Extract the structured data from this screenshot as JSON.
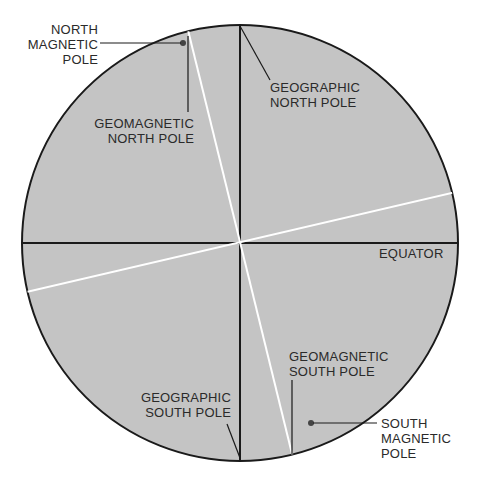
{
  "diagram": {
    "colors": {
      "globe_fill": "#c4c4c4",
      "outline": "#1a1a1a",
      "geomagnetic_axis": "#ffffff",
      "text": "#2a2a2a"
    },
    "labels": {
      "north_magnetic_pole": "NORTH\nMAGNETIC\nPOLE",
      "geomagnetic_north_pole": "GEOMAGNETIC\nNORTH POLE",
      "geographic_north_pole": "GEOGRAPHIC\nNORTH POLE",
      "equator": "EQUATOR",
      "geomagnetic_south_pole": "GEOMAGNETIC\nSOUTH POLE",
      "geographic_south_pole": "GEOGRAPHIC\nSOUTH POLE",
      "south_magnetic_pole": "SOUTH\nMAGNETIC\nPOLE"
    }
  }
}
